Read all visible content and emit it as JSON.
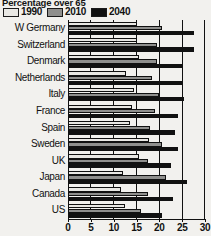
{
  "chart_data": {
    "type": "bar",
    "orientation": "horizontal",
    "title": "Percentage over 65",
    "xlabel": "",
    "ylabel": "",
    "xlim": [
      0,
      30
    ],
    "xticks": [
      0,
      5,
      10,
      15,
      20,
      25,
      30
    ],
    "xtick_labels": [
      "0",
      "5",
      "10",
      "15",
      "20",
      "25",
      "30"
    ],
    "grid": true,
    "legend_position": "top-left",
    "categories": [
      "W Germany",
      "Switzerland",
      "Denmark",
      "Netherlands",
      "Italy",
      "France",
      "Spain",
      "Sweden",
      "UK",
      "Japan",
      "Canada",
      "US"
    ],
    "series": [
      {
        "name": "1990",
        "color": "#e9e8e4",
        "values": [
          15.0,
          15.0,
          15.5,
          12.8,
          14.5,
          14.0,
          13.5,
          17.8,
          15.5,
          12.0,
          11.5,
          12.5
        ]
      },
      {
        "name": "2010",
        "color": "#8f8f8d",
        "values": [
          20.5,
          19.5,
          19.5,
          18.5,
          20.0,
          19.0,
          18.0,
          20.5,
          17.5,
          21.5,
          17.5,
          16.0
        ]
      },
      {
        "name": "2040",
        "color": "#111111",
        "values": [
          27.5,
          27.5,
          25.0,
          25.0,
          25.5,
          24.0,
          23.5,
          24.0,
          22.5,
          26.0,
          23.0,
          20.5
        ]
      }
    ]
  },
  "legend": {
    "items": [
      {
        "label": "1990",
        "color": "#e9e8e4"
      },
      {
        "label": "2010",
        "color": "#8f8f8d"
      },
      {
        "label": "2040",
        "color": "#111111"
      }
    ]
  }
}
